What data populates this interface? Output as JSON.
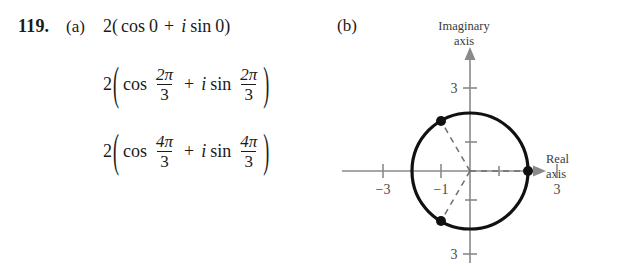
{
  "problem": {
    "number": "119.",
    "part_a_label": "(a)",
    "part_b_label": "(b)"
  },
  "expressions": [
    {
      "lead": "2",
      "open_paren": "(",
      "cos_label": "cos",
      "cos_arg_plain": "0",
      "plus": "+",
      "i_symbol": "i",
      "sin_label": "sin",
      "sin_arg_plain": "0",
      "close_paren": ")",
      "fraction": false
    },
    {
      "lead": "2",
      "open_paren": "(",
      "cos_label": "cos",
      "plus": "+",
      "i_symbol": "i",
      "sin_label": "sin",
      "close_paren": ")",
      "fraction": true,
      "numerator": "2π",
      "denominator": "3"
    },
    {
      "lead": "2",
      "open_paren": "(",
      "cos_label": "cos",
      "plus": "+",
      "i_symbol": "i",
      "sin_label": "sin",
      "close_paren": ")",
      "fraction": true,
      "numerator": "4π",
      "denominator": "3"
    }
  ],
  "diagram": {
    "imaginary_axis_label_line1": "Imaginary",
    "imaginary_axis_label_line2": "axis",
    "real_axis_label_line1": "Real",
    "real_axis_label_line2": "axis",
    "ticks": {
      "real_left_outer": "−3",
      "real_left_inner": "−1",
      "real_right_outer": "3",
      "imaginary_top": "3",
      "imaginary_bottom": "3"
    },
    "circle": {
      "radius_units": 2,
      "center": [
        0,
        0
      ]
    },
    "points": [
      {
        "label": "2(cos 0 + i sin 0)",
        "angle_deg": 0,
        "radius_units": 2
      },
      {
        "label": "2(cos 2π/3 + i sin 2π/3)",
        "angle_deg": 120,
        "radius_units": 2
      },
      {
        "label": "2(cos 4π/3 + i sin 4π/3)",
        "angle_deg": 240,
        "radius_units": 2
      }
    ],
    "colors": {
      "ink": "#1b1b1b",
      "axis": "#8a8a8a",
      "dashed": "#6f6f6f",
      "background": "#ffffff"
    }
  }
}
